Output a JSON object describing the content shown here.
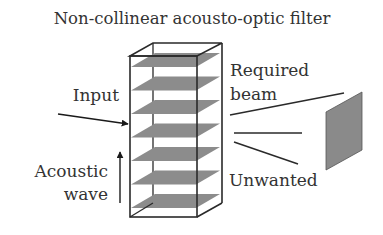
{
  "title": "Non-collinear acousto-optic filter",
  "labels": {
    "input": "Input",
    "acoustic_line1": "Acoustic",
    "acoustic_line2": "wave",
    "required_line1": "Required",
    "required_line2": "beam",
    "unwanted": "Unwanted"
  },
  "components": {
    "crystal_plate_count": 7,
    "plate_color": "#8c8c8c",
    "screen_color": "#8a8a8a",
    "line_color": "#2a2a2a"
  }
}
